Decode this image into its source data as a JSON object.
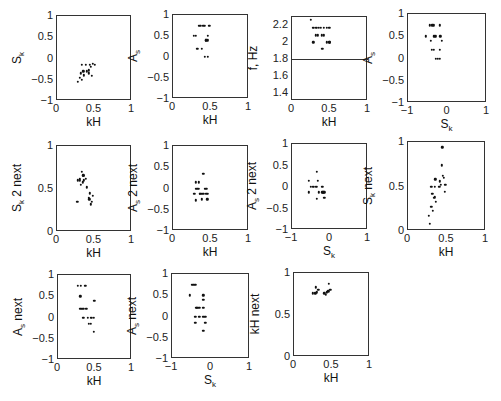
{
  "chart_data": [
    {
      "type": "scatter",
      "id": "p11",
      "xlabel": "kH",
      "ylabel": "S_k",
      "xlim": [
        0,
        1
      ],
      "ylim": [
        -1,
        1
      ],
      "xticks": [
        "0",
        "0.5",
        "1"
      ],
      "yticks": [
        "-1",
        "-0.5",
        "0",
        "0.5",
        "1"
      ],
      "x": [
        0.28,
        0.3,
        0.32,
        0.33,
        0.35,
        0.36,
        0.38,
        0.4,
        0.42,
        0.44,
        0.46,
        0.48,
        0.5,
        0.33,
        0.36,
        0.42,
        0.45
      ],
      "y": [
        -0.55,
        -0.45,
        -0.35,
        -0.5,
        -0.3,
        -0.4,
        -0.15,
        -0.3,
        -0.35,
        -0.15,
        -0.4,
        -0.12,
        -0.15,
        -0.15,
        -0.38,
        -0.28,
        -0.2
      ]
    },
    {
      "type": "scatter",
      "id": "p12",
      "xlabel": "kH",
      "ylabel": "A_s",
      "xlim": [
        0,
        1
      ],
      "ylim": [
        -1,
        1
      ],
      "xticks": [
        "0",
        "0.5",
        "1"
      ],
      "yticks": [
        "-1",
        "-0.5",
        "0",
        "0.5",
        "1"
      ],
      "x": [
        0.27,
        0.3,
        0.32,
        0.34,
        0.38,
        0.42,
        0.44,
        0.46,
        0.48,
        0.36,
        0.4,
        0.43,
        0.46,
        0.42,
        0.46
      ],
      "y": [
        0.5,
        0.5,
        0.2,
        0.75,
        0.2,
        0.75,
        0.4,
        0.4,
        0.75,
        0.75,
        0.75,
        0.4,
        0.5,
        0.0,
        0.0
      ]
    },
    {
      "type": "scatter",
      "id": "p13",
      "xlabel": "kH",
      "ylabel": "f, Hz",
      "xlim": [
        0,
        1
      ],
      "ylim": [
        1.3,
        2.3
      ],
      "xticks": [
        "0",
        "0.5",
        "1"
      ],
      "yticks": [
        "1.4",
        "1.6",
        "1.8",
        "2",
        "2.2"
      ],
      "hline": 1.8,
      "x": [
        0.25,
        0.27,
        0.29,
        0.31,
        0.33,
        0.35,
        0.38,
        0.42,
        0.46,
        0.49,
        0.31,
        0.34,
        0.39,
        0.42,
        0.28,
        0.46,
        0.49,
        0.4,
        0.5
      ],
      "y": [
        2.27,
        2.17,
        2.17,
        2.17,
        2.17,
        2.17,
        2.17,
        2.17,
        2.17,
        2.17,
        2.08,
        2.08,
        2.08,
        2.08,
        2.0,
        2.0,
        2.0,
        1.92,
        2.0
      ]
    },
    {
      "type": "scatter",
      "id": "p14",
      "xlabel": "S_k",
      "ylabel": "A_s",
      "xlim": [
        -1,
        1
      ],
      "ylim": [
        -1,
        1
      ],
      "xticks": [
        "-1",
        "0",
        "1"
      ],
      "yticks": [
        "-1",
        "-0.5",
        "0",
        "0.5",
        "1"
      ],
      "x": [
        -0.55,
        -0.45,
        -0.42,
        -0.38,
        -0.35,
        -0.3,
        -0.2,
        -0.18,
        -0.15,
        -0.4,
        -0.35,
        -0.2,
        -0.35,
        -0.3,
        -0.2,
        -0.32,
        -0.25
      ],
      "y": [
        0.5,
        0.75,
        0.4,
        0.75,
        0.5,
        0.5,
        0.75,
        0.5,
        0.4,
        0.2,
        0.2,
        0.2,
        0.75,
        0.0,
        0.0,
        0.5,
        0.0
      ]
    },
    {
      "type": "scatter",
      "id": "p21",
      "xlabel": "kH",
      "ylabel": "S_k 2 next",
      "xlim": [
        0,
        1
      ],
      "ylim": [
        0,
        1
      ],
      "xticks": [
        "0",
        "0.5",
        "1"
      ],
      "yticks": [
        "0",
        "0.5",
        "1"
      ],
      "x": [
        0.27,
        0.28,
        0.3,
        0.32,
        0.33,
        0.34,
        0.35,
        0.36,
        0.38,
        0.4,
        0.42,
        0.44,
        0.46,
        0.48,
        0.45,
        0.43,
        0.3,
        0.35
      ],
      "y": [
        0.35,
        0.6,
        0.62,
        0.55,
        0.7,
        0.58,
        0.65,
        0.6,
        0.62,
        0.52,
        0.4,
        0.45,
        0.35,
        0.42,
        0.32,
        0.38,
        0.6,
        0.66
      ]
    },
    {
      "type": "scatter",
      "id": "p22",
      "xlabel": "kH",
      "ylabel": "A_s 2 next",
      "xlim": [
        0,
        1
      ],
      "ylim": [
        -1,
        1
      ],
      "xticks": [
        "0",
        "0.5",
        "1"
      ],
      "yticks": [
        "-1",
        "-0.5",
        "0",
        "0.5",
        "1"
      ],
      "x": [
        0.28,
        0.3,
        0.32,
        0.34,
        0.36,
        0.38,
        0.4,
        0.42,
        0.44,
        0.46,
        0.3,
        0.35,
        0.4,
        0.45,
        0.3,
        0.44,
        0.34,
        0.38
      ],
      "y": [
        -0.12,
        0.0,
        0.0,
        0.0,
        -0.12,
        -0.12,
        0.35,
        0.0,
        0.0,
        -0.12,
        -0.28,
        -0.12,
        -0.12,
        -0.25,
        0.15,
        -0.12,
        0.15,
        -0.25
      ]
    },
    {
      "type": "scatter",
      "id": "p23",
      "xlabel": "S_k",
      "ylabel": "A_s 2 next",
      "xlim": [
        -1,
        1
      ],
      "ylim": [
        -1,
        1
      ],
      "xticks": [
        "-1",
        "0",
        "1"
      ],
      "yticks": [
        "-1",
        "-0.5",
        "0",
        "0.5",
        "1"
      ],
      "x": [
        -0.55,
        -0.5,
        -0.45,
        -0.42,
        -0.38,
        -0.35,
        -0.32,
        -0.2,
        -0.18,
        -0.15,
        -0.55,
        -0.35,
        -0.3,
        -0.2,
        -0.15,
        -0.35
      ],
      "y": [
        0.15,
        0.0,
        0.0,
        0.0,
        0.0,
        0.35,
        0.15,
        -0.12,
        -0.12,
        -0.12,
        -0.12,
        -0.28,
        -0.12,
        0.0,
        -0.25,
        0.0
      ]
    },
    {
      "type": "scatter",
      "id": "p24",
      "xlabel": "kH",
      "ylabel": "S_k next",
      "xlim": [
        0,
        1
      ],
      "ylim": [
        0,
        1
      ],
      "xticks": [
        "0",
        "0.5",
        "1"
      ],
      "yticks": [
        "0",
        "0.5",
        "1"
      ],
      "x": [
        0.28,
        0.27,
        0.3,
        0.32,
        0.33,
        0.31,
        0.34,
        0.35,
        0.36,
        0.4,
        0.41,
        0.42,
        0.43,
        0.45,
        0.46,
        0.48,
        0.47,
        0.44,
        0.3,
        0.34
      ],
      "y": [
        0.08,
        0.17,
        0.27,
        0.23,
        0.37,
        0.42,
        0.5,
        0.58,
        0.33,
        0.5,
        0.56,
        0.52,
        0.74,
        0.62,
        0.6,
        0.52,
        0.44,
        0.94,
        0.5,
        0.38
      ]
    },
    {
      "type": "scatter",
      "id": "p31",
      "xlabel": "kH",
      "ylabel": "A_s next",
      "xlim": [
        0,
        1
      ],
      "ylim": [
        -1,
        1
      ],
      "xticks": [
        "0",
        "0.5",
        "1"
      ],
      "yticks": [
        "-1",
        "-0.5",
        "0",
        "0.5",
        "1"
      ],
      "x": [
        0.27,
        0.31,
        0.37,
        0.3,
        0.3,
        0.32,
        0.34,
        0.38,
        0.34,
        0.4,
        0.44,
        0.46,
        0.48,
        0.42,
        0.44,
        0.49,
        0.48
      ],
      "y": [
        0.75,
        0.75,
        0.75,
        0.5,
        0.2,
        0.2,
        0.2,
        0.2,
        0.0,
        0.0,
        0.0,
        0.0,
        0.0,
        -0.15,
        -0.15,
        0.4,
        -0.33
      ]
    },
    {
      "type": "scatter",
      "id": "p32",
      "xlabel": "S_k",
      "ylabel": "A_s next",
      "xlim": [
        -1,
        1
      ],
      "ylim": [
        -1,
        1
      ],
      "xticks": [
        "-1",
        "0",
        "1"
      ],
      "yticks": [
        "-1",
        "-0.5",
        "0",
        "0.5",
        "1"
      ],
      "x": [
        -0.5,
        -0.45,
        -0.4,
        -0.55,
        -0.38,
        -0.35,
        -0.3,
        -0.2,
        -0.2,
        -0.4,
        -0.3,
        -0.2,
        -0.15,
        -0.4,
        -0.2,
        -0.15,
        -0.2
      ],
      "y": [
        0.75,
        0.75,
        0.75,
        0.5,
        0.2,
        0.2,
        0.2,
        0.5,
        0.4,
        0.0,
        0.0,
        0.0,
        0.0,
        -0.15,
        0.2,
        -0.15,
        -0.33
      ]
    },
    {
      "type": "scatter",
      "id": "p33",
      "xlabel": "kH",
      "ylabel": "kH next",
      "xlim": [
        0,
        1
      ],
      "ylim": [
        0,
        1
      ],
      "xticks": [
        "0",
        "0.5",
        "1"
      ],
      "yticks": [
        "0",
        "0.5",
        "1"
      ],
      "x": [
        0.25,
        0.28,
        0.3,
        0.32,
        0.29,
        0.4,
        0.43,
        0.45,
        0.48,
        0.46,
        0.42
      ],
      "y": [
        0.76,
        0.76,
        0.77,
        0.8,
        0.83,
        0.76,
        0.77,
        0.78,
        0.8,
        0.87,
        0.74
      ]
    }
  ]
}
